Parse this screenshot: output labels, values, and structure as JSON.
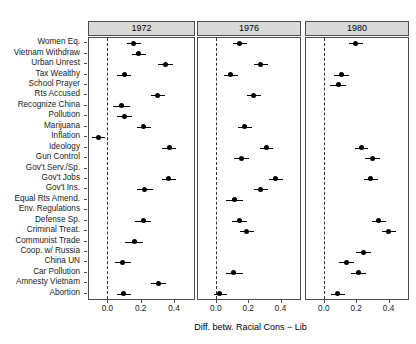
{
  "chart_data": {
    "type": "scatter",
    "subtype": "dot-whisker-coefficient-plot",
    "title": "",
    "xlabel": "Diff. betw. Racial Cons − Lib",
    "ylabel": "",
    "xlim": [
      -0.11,
      0.52
    ],
    "xticks": [
      0.0,
      0.2,
      0.4
    ],
    "xticklabels": [
      "0.0",
      "0.2",
      "0.4"
    ],
    "grid": false,
    "reference_line": 0.0,
    "reference_line_style": "dashed",
    "legend": "none",
    "categories": [
      "Women Eq.",
      "Vietnam Withdraw",
      "Urban Unrest",
      "Tax Wealthy",
      "School Prayer",
      "Rts Accused",
      "Recognize China",
      "Pollution",
      "Marijuana",
      "Inflation",
      "Ideology",
      "Gun Control",
      "Gov't Serv./Sp.",
      "Gov't Jobs",
      "Gov't Ins.",
      "Equal Rts Amend.",
      "Env. Regulations",
      "Defense Sp.",
      "Criminal Treat.",
      "Communist Trade",
      "Coop. w/ Russia",
      "China UN",
      "Car Pollution",
      "Amnesty Vietnam",
      "Abortion"
    ],
    "panels": [
      {
        "label": "1972",
        "points": [
          {
            "category": "Women Eq.",
            "estimate": 0.155,
            "low": 0.115,
            "high": 0.2
          },
          {
            "category": "Vietnam Withdraw",
            "estimate": 0.185,
            "low": 0.145,
            "high": 0.23
          },
          {
            "category": "Urban Unrest",
            "estimate": 0.35,
            "low": 0.305,
            "high": 0.395
          },
          {
            "category": "Tax Wealthy",
            "estimate": 0.1,
            "low": 0.06,
            "high": 0.145
          },
          {
            "category": "School Prayer",
            "estimate": null,
            "low": null,
            "high": null
          },
          {
            "category": "Rts Accused",
            "estimate": 0.3,
            "low": 0.26,
            "high": 0.345
          },
          {
            "category": "Recognize China",
            "estimate": 0.085,
            "low": 0.035,
            "high": 0.135
          },
          {
            "category": "Pollution",
            "estimate": 0.1,
            "low": 0.055,
            "high": 0.145
          },
          {
            "category": "Marijuana",
            "estimate": 0.215,
            "low": 0.175,
            "high": 0.26
          },
          {
            "category": "Inflation",
            "estimate": -0.055,
            "low": -0.09,
            "high": -0.015
          },
          {
            "category": "Ideology",
            "estimate": 0.37,
            "low": 0.33,
            "high": 0.415
          },
          {
            "category": "Gun Control",
            "estimate": null,
            "low": null,
            "high": null
          },
          {
            "category": "Gov't Serv./Sp.",
            "estimate": null,
            "low": null,
            "high": null
          },
          {
            "category": "Gov't Jobs",
            "estimate": 0.365,
            "low": 0.325,
            "high": 0.41
          },
          {
            "category": "Gov't Ins.",
            "estimate": 0.225,
            "low": 0.18,
            "high": 0.275
          },
          {
            "category": "Equal Rts Amend.",
            "estimate": null,
            "low": null,
            "high": null
          },
          {
            "category": "Env. Regulations",
            "estimate": null,
            "low": null,
            "high": null
          },
          {
            "category": "Defense Sp.",
            "estimate": 0.215,
            "low": 0.165,
            "high": 0.265
          },
          {
            "category": "Criminal Treat.",
            "estimate": null,
            "low": null,
            "high": null
          },
          {
            "category": "Communist Trade",
            "estimate": 0.16,
            "low": 0.105,
            "high": 0.215
          },
          {
            "category": "Coop. w/ Russia",
            "estimate": null,
            "low": null,
            "high": null
          },
          {
            "category": "China UN",
            "estimate": 0.09,
            "low": 0.045,
            "high": 0.14
          },
          {
            "category": "Car Pollution",
            "estimate": null,
            "low": null,
            "high": null
          },
          {
            "category": "Amnesty Vietnam",
            "estimate": 0.305,
            "low": 0.26,
            "high": 0.355
          },
          {
            "category": "Abortion",
            "estimate": 0.095,
            "low": 0.06,
            "high": 0.14
          }
        ]
      },
      {
        "label": "1976",
        "points": [
          {
            "category": "Women Eq.",
            "estimate": 0.145,
            "low": 0.105,
            "high": 0.19
          },
          {
            "category": "Vietnam Withdraw",
            "estimate": null,
            "low": null,
            "high": null
          },
          {
            "category": "Urban Unrest",
            "estimate": 0.275,
            "low": 0.235,
            "high": 0.32
          },
          {
            "category": "Tax Wealthy",
            "estimate": 0.09,
            "low": 0.05,
            "high": 0.135
          },
          {
            "category": "School Prayer",
            "estimate": null,
            "low": null,
            "high": null
          },
          {
            "category": "Rts Accused",
            "estimate": 0.235,
            "low": 0.19,
            "high": 0.28
          },
          {
            "category": "Recognize China",
            "estimate": null,
            "low": null,
            "high": null
          },
          {
            "category": "Pollution",
            "estimate": null,
            "low": null,
            "high": null
          },
          {
            "category": "Marijuana",
            "estimate": 0.18,
            "low": 0.14,
            "high": 0.225
          },
          {
            "category": "Inflation",
            "estimate": null,
            "low": null,
            "high": null
          },
          {
            "category": "Ideology",
            "estimate": 0.31,
            "low": 0.27,
            "high": 0.355
          },
          {
            "category": "Gun Control",
            "estimate": 0.16,
            "low": 0.115,
            "high": 0.205
          },
          {
            "category": "Gov't Serv./Sp.",
            "estimate": null,
            "low": null,
            "high": null
          },
          {
            "category": "Gov't Jobs",
            "estimate": 0.37,
            "low": 0.33,
            "high": 0.415
          },
          {
            "category": "Gov't Ins.",
            "estimate": 0.275,
            "low": 0.235,
            "high": 0.32
          },
          {
            "category": "Equal Rts Amend.",
            "estimate": 0.115,
            "low": 0.065,
            "high": 0.165
          },
          {
            "category": "Env. Regulations",
            "estimate": null,
            "low": null,
            "high": null
          },
          {
            "category": "Defense Sp.",
            "estimate": 0.145,
            "low": 0.1,
            "high": 0.19
          },
          {
            "category": "Criminal Treat.",
            "estimate": 0.19,
            "low": 0.15,
            "high": 0.235
          },
          {
            "category": "Communist Trade",
            "estimate": null,
            "low": null,
            "high": null
          },
          {
            "category": "Coop. w/ Russia",
            "estimate": null,
            "low": null,
            "high": null
          },
          {
            "category": "China UN",
            "estimate": null,
            "low": null,
            "high": null
          },
          {
            "category": "Car Pollution",
            "estimate": 0.11,
            "low": 0.06,
            "high": 0.165
          },
          {
            "category": "Amnesty Vietnam",
            "estimate": null,
            "low": null,
            "high": null
          },
          {
            "category": "Abortion",
            "estimate": 0.025,
            "low": -0.01,
            "high": 0.07
          }
        ]
      },
      {
        "label": "1980",
        "points": [
          {
            "category": "Women Eq.",
            "estimate": 0.195,
            "low": 0.155,
            "high": 0.24
          },
          {
            "category": "Vietnam Withdraw",
            "estimate": null,
            "low": null,
            "high": null
          },
          {
            "category": "Urban Unrest",
            "estimate": null,
            "low": null,
            "high": null
          },
          {
            "category": "Tax Wealthy",
            "estimate": 0.11,
            "low": 0.065,
            "high": 0.155
          },
          {
            "category": "School Prayer",
            "estimate": 0.09,
            "low": 0.04,
            "high": 0.14
          },
          {
            "category": "Rts Accused",
            "estimate": null,
            "low": null,
            "high": null
          },
          {
            "category": "Recognize China",
            "estimate": null,
            "low": null,
            "high": null
          },
          {
            "category": "Pollution",
            "estimate": null,
            "low": null,
            "high": null
          },
          {
            "category": "Marijuana",
            "estimate": null,
            "low": null,
            "high": null
          },
          {
            "category": "Inflation",
            "estimate": null,
            "low": null,
            "high": null
          },
          {
            "category": "Ideology",
            "estimate": 0.23,
            "low": 0.19,
            "high": 0.275
          },
          {
            "category": "Gun Control",
            "estimate": 0.3,
            "low": 0.255,
            "high": 0.345
          },
          {
            "category": "Gov't Serv./Sp.",
            "estimate": null,
            "low": null,
            "high": null
          },
          {
            "category": "Gov't Jobs",
            "estimate": 0.29,
            "low": 0.25,
            "high": 0.335
          },
          {
            "category": "Gov't Ins.",
            "estimate": null,
            "low": null,
            "high": null
          },
          {
            "category": "Equal Rts Amend.",
            "estimate": null,
            "low": null,
            "high": null
          },
          {
            "category": "Env. Regulations",
            "estimate": null,
            "low": null,
            "high": null
          },
          {
            "category": "Defense Sp.",
            "estimate": 0.34,
            "low": 0.3,
            "high": 0.385
          },
          {
            "category": "Criminal Treat.",
            "estimate": 0.4,
            "low": 0.36,
            "high": 0.445
          },
          {
            "category": "Communist Trade",
            "estimate": null,
            "low": null,
            "high": null
          },
          {
            "category": "Coop. w/ Russia",
            "estimate": 0.245,
            "low": 0.2,
            "high": 0.29
          },
          {
            "category": "China UN",
            "estimate": 0.14,
            "low": 0.095,
            "high": 0.185
          },
          {
            "category": "Car Pollution",
            "estimate": 0.215,
            "low": 0.17,
            "high": 0.26
          },
          {
            "category": "Amnesty Vietnam",
            "estimate": null,
            "low": null,
            "high": null
          },
          {
            "category": "Abortion",
            "estimate": 0.085,
            "low": 0.045,
            "high": 0.13
          }
        ]
      }
    ]
  }
}
